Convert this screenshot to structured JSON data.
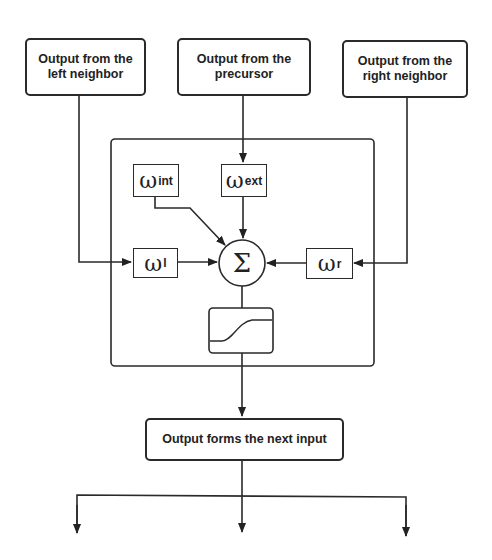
{
  "diagram": {
    "inputs": {
      "left_neighbor": "Output from the left neighbor",
      "precursor": "Output from the precursor",
      "right_neighbor": "Output from the right neighbor"
    },
    "weights": {
      "internal": {
        "symbol": "ω",
        "subscript": "int"
      },
      "external": {
        "symbol": "ω",
        "subscript": "ext"
      },
      "left": {
        "symbol": "ω",
        "subscript": "l"
      },
      "right": {
        "symbol": "ω",
        "subscript": "r"
      }
    },
    "summation_symbol": "Σ",
    "activation": "sigmoid-icon",
    "output": "Output forms the next input",
    "output_branches": 3,
    "colors": {
      "stroke": "#2a2a2a",
      "background": "#ffffff"
    }
  }
}
